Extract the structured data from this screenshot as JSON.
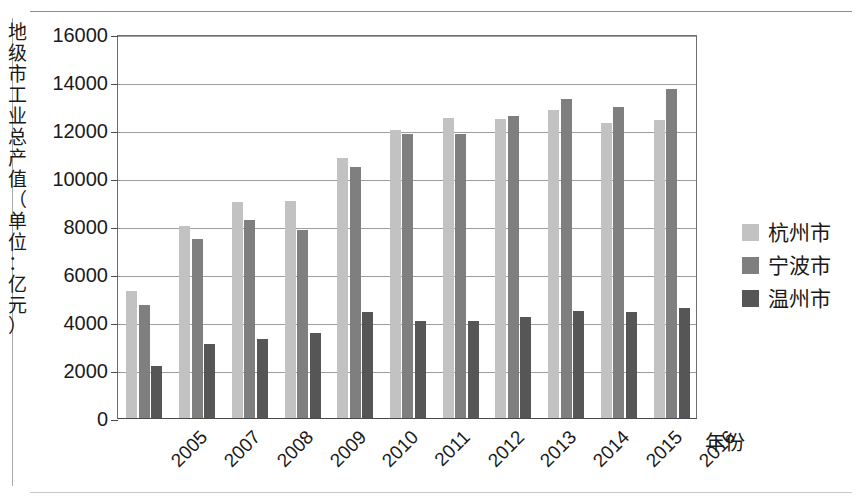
{
  "chart_data": {
    "type": "bar",
    "title": "",
    "xlabel": "年份",
    "ylabel": "地级市工业总产值（单位：亿元）",
    "categories": [
      "2005",
      "2007",
      "2008",
      "2009",
      "2010",
      "2011",
      "2012",
      "2013",
      "2014",
      "2015",
      "2016"
    ],
    "series": [
      {
        "name": "杭州市",
        "color": "#c2c2c2",
        "values": [
          5300,
          8000,
          9000,
          9050,
          10850,
          12000,
          12500,
          12450,
          12850,
          12300,
          12400
        ]
      },
      {
        "name": "宁波市",
        "color": "#7f7f7f",
        "values": [
          4700,
          7450,
          8250,
          7850,
          10450,
          11850,
          11850,
          12600,
          13300,
          12950,
          13700
        ]
      },
      {
        "name": "温州市",
        "color": "#565656",
        "values": [
          2150,
          3100,
          3300,
          3550,
          4400,
          4050,
          4050,
          4200,
          4450,
          4400,
          4600
        ]
      }
    ],
    "ylim": [
      0,
      16000
    ],
    "ytick_step": 2000,
    "yticks": [
      "0",
      "2000",
      "4000",
      "6000",
      "8000",
      "10000",
      "12000",
      "14000",
      "16000"
    ],
    "grid": true,
    "legend_position": "right"
  },
  "y_axis_title_chars": [
    "地",
    "级",
    "市",
    "工",
    "业",
    "总",
    "产",
    "值",
    "（",
    "单",
    "位",
    "：",
    "亿",
    "元",
    "）"
  ],
  "legend": {
    "items": [
      {
        "label": "杭州市",
        "swatch": "series-0-swatch"
      },
      {
        "label": "宁波市",
        "swatch": "series-1-swatch"
      },
      {
        "label": "温州市",
        "swatch": "series-2-swatch"
      }
    ]
  }
}
